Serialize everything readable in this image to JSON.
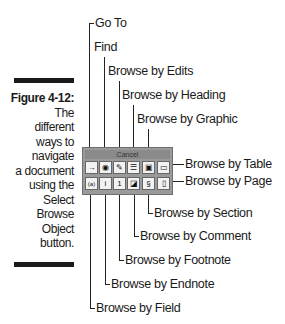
{
  "figure": {
    "number_label": "Figure 4-12:",
    "caption_lines": [
      "The",
      "different",
      "ways to",
      "navigate",
      "a document",
      "using the",
      "Select",
      "Browse",
      "Object",
      "button."
    ]
  },
  "toolbar": {
    "title": "Cancel",
    "row1": [
      {
        "name": "go-to",
        "glyph": "→"
      },
      {
        "name": "find",
        "glyph": "🔭"
      },
      {
        "name": "browse-by-edits",
        "glyph": "✎"
      },
      {
        "name": "browse-by-heading",
        "glyph": "☰"
      },
      {
        "name": "browse-by-graphic",
        "glyph": "▣"
      },
      {
        "name": "browse-by-table",
        "glyph": "▭"
      }
    ],
    "row2": [
      {
        "name": "browse-by-field",
        "glyph": "(a)"
      },
      {
        "name": "browse-by-endnote",
        "glyph": "i"
      },
      {
        "name": "browse-by-footnote",
        "glyph": "1"
      },
      {
        "name": "browse-by-comment",
        "glyph": "◪"
      },
      {
        "name": "browse-by-section",
        "glyph": "§"
      },
      {
        "name": "browse-by-page",
        "glyph": "▯"
      }
    ]
  },
  "callouts": {
    "go_to": "Go To",
    "find": "Find",
    "edits": "Browse by Edits",
    "heading": "Browse by Heading",
    "graphic": "Browse by Graphic",
    "table": "Browse by Table",
    "page": "Browse by Page",
    "section": "Browse by Section",
    "comment": "Browse by Comment",
    "footnote": "Browse by Footnote",
    "endnote": "Browse by Endnote",
    "field": "Browse by Field"
  }
}
